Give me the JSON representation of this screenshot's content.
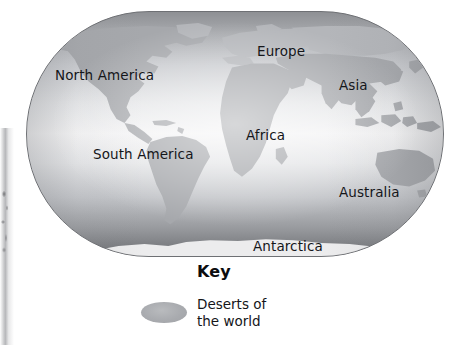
{
  "figure": {
    "type": "thematic-world-map",
    "subject": "Deserts of the world"
  },
  "map": {
    "projection_shape": "rounded-rectangle-globe",
    "ocean_fill": "#e6e7e9",
    "land_fill": "#a6a8ac",
    "antarctica_fill": "#ececed",
    "border_color": "#6e7074",
    "labels": [
      {
        "name": "label-north-america",
        "text": "North America",
        "x": 28,
        "y": 57
      },
      {
        "name": "label-europe",
        "text": "Europe",
        "x": 230,
        "y": 33
      },
      {
        "name": "label-asia",
        "text": "Asia",
        "x": 312,
        "y": 67
      },
      {
        "name": "label-africa",
        "text": "Africa",
        "x": 219,
        "y": 117
      },
      {
        "name": "label-south-america",
        "text": "South America",
        "x": 66,
        "y": 136
      },
      {
        "name": "label-australia",
        "text": "Australia",
        "x": 312,
        "y": 174
      },
      {
        "name": "label-antarctica",
        "text": "Antarctica",
        "x": 226,
        "y": 228
      }
    ]
  },
  "key": {
    "title": "Key",
    "entries": [
      {
        "name": "key-entry-deserts",
        "label": "Deserts of\nthe world",
        "swatch_shape": "ellipse",
        "swatch_color": "#a9abaf"
      }
    ]
  }
}
